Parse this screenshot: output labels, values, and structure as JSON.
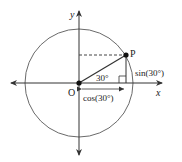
{
  "diagram": {
    "type": "unit-circle",
    "labels": {
      "y_axis": "y",
      "x_axis": "x",
      "origin": "O",
      "point": "P",
      "angle": "30°",
      "sin": "sin(30°)",
      "cos": "cos(30°)"
    },
    "angle_degrees": 30,
    "colors": {
      "stroke": "#555555",
      "axis": "#333333",
      "circle": "#6a6a6a",
      "point": "#111111"
    }
  }
}
